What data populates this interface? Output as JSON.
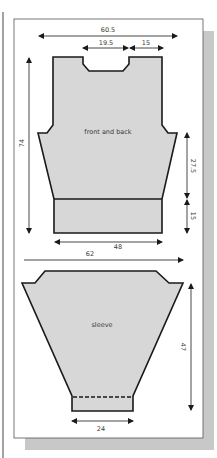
{
  "diagram": {
    "colors": {
      "piece_fill": "#d7d7d7",
      "outline": "#1a1a1a",
      "panel_bg": "#ffffff",
      "shadow": "#c8c8c8",
      "frame": "#555555"
    },
    "pieces": {
      "body": {
        "label": "front and back"
      },
      "sleeve": {
        "label": "sleeve"
      }
    },
    "measurements": {
      "body_width_top": "60.5",
      "neck_width": "19.5",
      "shoulder_width": "15",
      "body_length": "74",
      "side_length": "27.5",
      "rib_length": "15",
      "body_width_bottom": "48",
      "sleeve_width_top": "62",
      "sleeve_length": "47",
      "cuff_width": "24"
    }
  }
}
